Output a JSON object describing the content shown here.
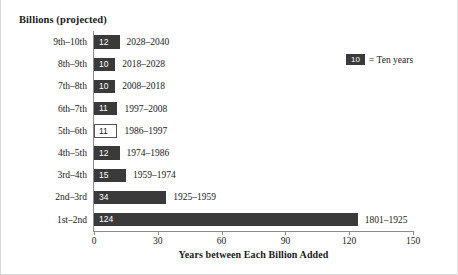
{
  "chart_data": {
    "type": "bar",
    "orientation": "horizontal",
    "title": "Billions (projected)",
    "xlabel": "Years between Each Billion Added",
    "ylabel": "",
    "xlim": [
      0,
      150
    ],
    "xticks": [
      0,
      30,
      60,
      90,
      120,
      150
    ],
    "grid": false,
    "categories": [
      "9th–10th",
      "8th–9th",
      "7th–8th",
      "6th–7th",
      "5th–6th",
      "4th–5th",
      "3rd–4th",
      "2nd–3rd",
      "1st–2nd"
    ],
    "values": [
      12,
      10,
      10,
      11,
      11,
      12,
      15,
      34,
      124
    ],
    "bars": [
      {
        "category": "9th–10th",
        "value": 12,
        "value_label": "12",
        "range": "2028–2040",
        "style": "filled"
      },
      {
        "category": "8th–9th",
        "value": 10,
        "value_label": "10",
        "range": "2018–2028",
        "style": "filled"
      },
      {
        "category": "7th–8th",
        "value": 10,
        "value_label": "10",
        "range": "2008–2018",
        "style": "filled"
      },
      {
        "category": "6th–7th",
        "value": 11,
        "value_label": "11",
        "range": "1997–2008",
        "style": "filled"
      },
      {
        "category": "5th–6th",
        "value": 11,
        "value_label": "11",
        "range": "1986–1997",
        "style": "hollow"
      },
      {
        "category": "4th–5th",
        "value": 12,
        "value_label": "12",
        "range": "1974–1986",
        "style": "filled"
      },
      {
        "category": "3rd–4th",
        "value": 15,
        "value_label": "15",
        "range": "1959–1974",
        "style": "filled"
      },
      {
        "category": "2nd–3rd",
        "value": 34,
        "value_label": "34",
        "range": "1925–1959",
        "style": "filled"
      },
      {
        "category": "1st–2nd",
        "value": 124,
        "value_label": "124",
        "range": "1801–1925",
        "style": "filled"
      }
    ],
    "legend": {
      "position": "top-right",
      "swatch_label": "10",
      "text": "= Ten years"
    },
    "colors": {
      "bar_fill": "#3a3a3a",
      "bar_hollow_border": "#555555",
      "axis": "#8d8d8d",
      "text": "#1a1a1a",
      "bar_value_text": "#ffffff",
      "background": "#ffffff"
    }
  }
}
